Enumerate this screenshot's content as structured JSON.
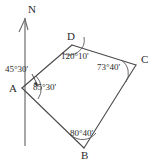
{
  "figure": {
    "background_color": "#ffffff",
    "line_color": "#4a4a4a",
    "north_line_color": "#8a8a8a",
    "text_color": "#2b2b2b"
  },
  "north": {
    "label": "N",
    "icon": "north-arrow-icon"
  },
  "vertices": {
    "a": {
      "label": "A",
      "x": 22,
      "y": 88
    },
    "b": {
      "label": "B",
      "x": 84,
      "y": 148
    },
    "c": {
      "label": "C",
      "x": 136,
      "y": 65
    },
    "d": {
      "label": "D",
      "x": 72,
      "y": 45
    }
  },
  "angles": {
    "bearing": {
      "value": "45°30'",
      "degrees": 45,
      "minutes": 30
    },
    "at_a": {
      "value": "85°30'",
      "degrees": 85,
      "minutes": 30
    },
    "at_b": {
      "value": "80°40'",
      "degrees": 80,
      "minutes": 40
    },
    "at_c": {
      "value": "73°40'",
      "degrees": 73,
      "minutes": 40
    },
    "at_d": {
      "value": "120°10'",
      "degrees": 120,
      "minutes": 10
    }
  }
}
